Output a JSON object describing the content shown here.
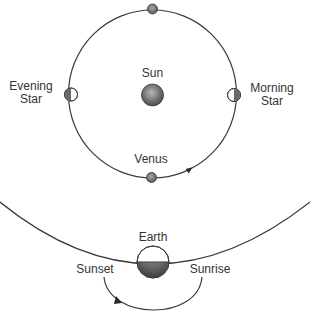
{
  "diagram": {
    "type": "astronomy",
    "labels": {
      "sun": "Sun",
      "venus": "Venus",
      "evening_star_line1": "Evening",
      "evening_star_line2": "Star",
      "morning_star_line1": "Morning",
      "morning_star_line2": "Star",
      "earth": "Earth",
      "sunset": "Sunset",
      "sunrise": "Sunrise"
    },
    "colors": {
      "line": "#3a3a3a",
      "body_fill_light": "#bdbdbd",
      "body_fill_dark": "#555555",
      "text": "#333333"
    }
  }
}
